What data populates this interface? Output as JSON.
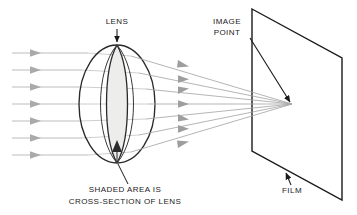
{
  "diagram": {
    "background_color": "#ffffff",
    "ink_color": "#1a1a1a",
    "ray_color": "#9a9a9a",
    "shade_color": "#ededeb",
    "labels": {
      "lens": "LENS",
      "image_point_line1": "IMAGE",
      "image_point_line2": "POINT",
      "film": "FILM",
      "caption_line1": "SHADED AREA IS",
      "caption_line2": "CROSS-SECTION OF LENS"
    },
    "geometry": {
      "lens_center_x": 117,
      "lens_center_y": 104,
      "lens_rx": 38,
      "lens_ry": 59,
      "lens_cross_section_half_width": 14,
      "focal_point_x": 292,
      "focal_point_y": 104,
      "incoming_ray_count": 7,
      "incoming_ray_y": [
        53,
        70,
        87,
        104,
        121,
        138,
        155
      ],
      "incoming_ray_start_x": 12,
      "film_corners": [
        [
          252,
          9
        ],
        [
          342,
          58
        ],
        [
          342,
          200
        ],
        [
          252,
          151
        ]
      ]
    }
  }
}
